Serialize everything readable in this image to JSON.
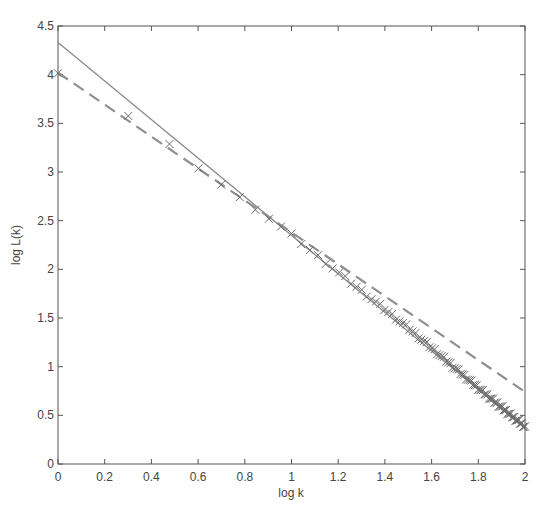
{
  "chart_data": {
    "type": "line",
    "title": "",
    "xlabel": "log k",
    "ylabel": "log L(k)",
    "xlim": [
      0,
      2
    ],
    "ylim": [
      0,
      4.5
    ],
    "xticks": [
      0,
      0.2,
      0.4,
      0.6,
      0.8,
      1,
      1.2,
      1.4,
      1.6,
      1.8,
      2
    ],
    "xtick_labels": [
      "0",
      "0.2",
      "0.4",
      "0.6",
      "0.8",
      "1",
      "1.2",
      "1.4",
      "1.6",
      "1.8",
      "2"
    ],
    "yticks": [
      0,
      0.5,
      1,
      1.5,
      2,
      2.5,
      3,
      3.5,
      4,
      4.5
    ],
    "ytick_labels": [
      "0",
      "0.5",
      "1",
      "1.5",
      "2",
      "2.5",
      "3",
      "3.5",
      "4",
      "4.5"
    ],
    "grid": false,
    "legend": null,
    "colors": {
      "axis": "#555555",
      "solid_line": "#8a8a8a",
      "dashed_line": "#8f8f8f",
      "markers": "#6a6a6a"
    },
    "series": [
      {
        "name": "fit-solid",
        "style": "solid",
        "x": [
          0,
          2
        ],
        "y": [
          4.33,
          0.37
        ]
      },
      {
        "name": "fit-dashed",
        "style": "dashed",
        "x": [
          0,
          2
        ],
        "y": [
          4.02,
          0.74
        ]
      },
      {
        "name": "data-markers",
        "style": "x-markers",
        "k_range": [
          1,
          100
        ],
        "x_formula": "log10(k)",
        "sample_points": [
          {
            "x": 0,
            "y": 4.02
          },
          {
            "x": 0.301,
            "y": 3.57
          },
          {
            "x": 0.477,
            "y": 3.27
          },
          {
            "x": 0.602,
            "y": 3.05
          },
          {
            "x": 0.699,
            "y": 2.87
          },
          {
            "x": 0.778,
            "y": 2.73
          },
          {
            "x": 0.845,
            "y": 2.63
          },
          {
            "x": 1.0,
            "y": 2.35
          },
          {
            "x": 1.2,
            "y": 1.97
          },
          {
            "x": 1.5,
            "y": 1.4
          },
          {
            "x": 1.8,
            "y": 0.78
          },
          {
            "x": 2.0,
            "y": 0.38
          }
        ]
      }
    ]
  }
}
